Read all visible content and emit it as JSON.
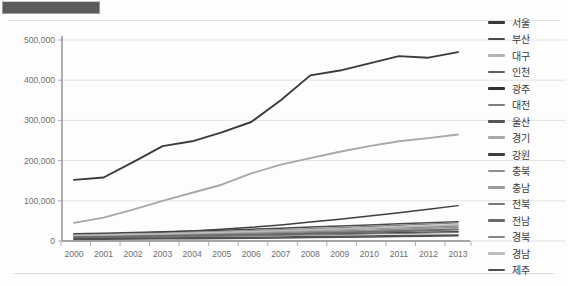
{
  "window": {
    "selection_bar_label": ""
  },
  "chart_data": {
    "type": "line",
    "title": "",
    "xlabel": "",
    "ylabel": "",
    "x": [
      2000,
      2001,
      2002,
      2003,
      2004,
      2005,
      2006,
      2007,
      2008,
      2009,
      2010,
      2011,
      2012,
      2013
    ],
    "categories": [
      "2000",
      "2001",
      "2002",
      "2003",
      "2004",
      "2005",
      "2006",
      "2007",
      "2008",
      "2009",
      "2010",
      "2011",
      "2012",
      "2013"
    ],
    "ylim": [
      0,
      500000
    ],
    "yticks": [
      0,
      100000,
      200000,
      300000,
      400000,
      500000
    ],
    "ytick_labels": [
      "0",
      "100,000",
      "200,000",
      "300,000",
      "400,000",
      "500,000"
    ],
    "grid": true,
    "legend_position": "right",
    "series": [
      {
        "name": "서울",
        "color": "#3b3b3b",
        "width": 1.9,
        "values": [
          152000,
          158000,
          196000,
          236000,
          248000,
          270000,
          296000,
          350000,
          412000,
          424000,
          442000,
          460000,
          456000,
          470000
        ]
      },
      {
        "name": "부산",
        "color": "#4a4a4a",
        "width": 1.5,
        "values": [
          18000,
          19500,
          21000,
          23000,
          25000,
          27000,
          29500,
          32000,
          35000,
          37500,
          40000,
          43000,
          45500,
          48000
        ]
      },
      {
        "name": "대구",
        "color": "#b4b4b4",
        "width": 1.4,
        "values": [
          12000,
          13000,
          14000,
          15000,
          16500,
          18000,
          19500,
          21000,
          22500,
          24000,
          25500,
          27000,
          28500,
          30000
        ]
      },
      {
        "name": "인천",
        "color": "#5e5e5e",
        "width": 1.5,
        "values": [
          14000,
          15200,
          16500,
          18000,
          19500,
          21500,
          23500,
          25500,
          27500,
          29500,
          31500,
          33500,
          35500,
          38000
        ]
      },
      {
        "name": "광주",
        "color": "#2f2f2f",
        "width": 1.6,
        "values": [
          9000,
          9800,
          10600,
          11500,
          12500,
          13500,
          14500,
          15500,
          16800,
          18000,
          19200,
          20500,
          21800,
          23000
        ]
      },
      {
        "name": "대전",
        "color": "#7d7d7d",
        "width": 1.4,
        "values": [
          8500,
          9200,
          10000,
          10800,
          11700,
          12600,
          13600,
          14600,
          15600,
          16700,
          17800,
          19000,
          20200,
          21500
        ]
      },
      {
        "name": "울산",
        "color": "#545454",
        "width": 1.5,
        "values": [
          5500,
          6000,
          6600,
          7200,
          7900,
          8600,
          9300,
          10100,
          10900,
          11700,
          12500,
          13400,
          14300,
          15200
        ]
      },
      {
        "name": "경기",
        "color": "#a8a8a8",
        "width": 1.9,
        "values": [
          45000,
          58000,
          78000,
          100000,
          120000,
          140000,
          168000,
          190000,
          206000,
          222000,
          236000,
          248000,
          256000,
          265000
        ]
      },
      {
        "name": "강원",
        "color": "#3f3f3f",
        "width": 1.5,
        "values": [
          16000,
          17500,
          19500,
          22000,
          25000,
          29000,
          34000,
          40000,
          47000,
          54000,
          62000,
          70000,
          79000,
          88000
        ]
      },
      {
        "name": "충북",
        "color": "#8f8f8f",
        "width": 1.4,
        "values": [
          11000,
          12000,
          13200,
          14500,
          16000,
          17600,
          19300,
          21100,
          23000,
          25000,
          27100,
          29300,
          31600,
          34000
        ]
      },
      {
        "name": "충남",
        "color": "#9b9b9b",
        "width": 1.4,
        "values": [
          13000,
          14300,
          15700,
          17200,
          18900,
          20700,
          22600,
          24600,
          26700,
          28900,
          31200,
          33600,
          36100,
          38700
        ]
      },
      {
        "name": "전북",
        "color": "#777777",
        "width": 1.4,
        "values": [
          10000,
          10900,
          11900,
          13000,
          14200,
          15500,
          16900,
          18400,
          20000,
          21700,
          23500,
          25400,
          27400,
          29500
        ]
      },
      {
        "name": "전남",
        "color": "#6a6a6a",
        "width": 1.4,
        "values": [
          9500,
          10300,
          11200,
          12200,
          13300,
          14500,
          15800,
          17200,
          18700,
          20300,
          22000,
          23800,
          25700,
          27700
        ]
      },
      {
        "name": "경북",
        "color": "#868686",
        "width": 1.4,
        "values": [
          15000,
          16400,
          18000,
          19700,
          21600,
          23600,
          25800,
          28100,
          30600,
          33200,
          36000,
          39000,
          42100,
          45400
        ]
      },
      {
        "name": "경남",
        "color": "#bdbdbd",
        "width": 1.4,
        "values": [
          14000,
          15300,
          16700,
          18200,
          19900,
          21700,
          23600,
          25700,
          27900,
          30200,
          32700,
          35300,
          38000,
          40900
        ]
      },
      {
        "name": "제주",
        "color": "#4f4f4f",
        "width": 1.5,
        "values": [
          4000,
          4400,
          4800,
          5300,
          5800,
          6400,
          7000,
          7700,
          8400,
          9200,
          10000,
          10900,
          11800,
          12800
        ]
      }
    ]
  }
}
